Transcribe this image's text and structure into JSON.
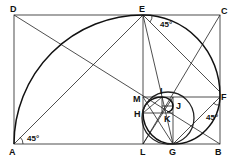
{
  "diagram": {
    "points": {
      "A": "A",
      "B": "B",
      "C": "C",
      "D": "D",
      "E": "E",
      "F": "F",
      "G": "G",
      "H": "H",
      "I": "I",
      "J": "J",
      "K": "K",
      "L": "L",
      "M": "M"
    },
    "angles": {
      "at_A": "45°",
      "at_E": "45°",
      "at_F": "45°"
    },
    "colors": {
      "line": "#222222",
      "background": "#ffffff"
    }
  }
}
